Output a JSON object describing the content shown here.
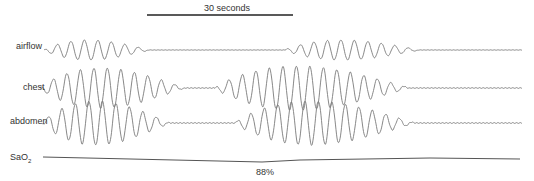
{
  "scale_bar": {
    "label": "30 seconds"
  },
  "channels": [
    {
      "label": "airflow"
    },
    {
      "label": "chest"
    },
    {
      "label": "abdomen"
    },
    {
      "label": "SaO",
      "subscript": "2"
    }
  ],
  "annotations": {
    "sao2_nadir": "88%"
  },
  "colors": {
    "trace": "#7a7a7a",
    "text": "#333333",
    "scale_bar": "#222222"
  }
}
